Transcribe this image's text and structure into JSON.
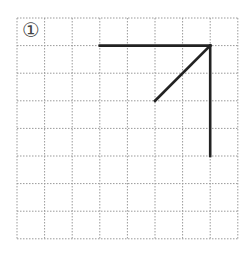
{
  "figure": {
    "label": "①",
    "grid": {
      "origin_x": 17,
      "origin_y": 18,
      "cell": 27.6,
      "cols": 8,
      "rows": 8,
      "line_color": "#9a9a9a"
    },
    "segments": [
      {
        "name": "top-horizontal-line",
        "from": [
          3,
          1
        ],
        "to": [
          7,
          1
        ]
      },
      {
        "name": "right-vertical-line",
        "from": [
          7,
          1
        ],
        "to": [
          7,
          5
        ]
      },
      {
        "name": "diagonal-line",
        "from": [
          7,
          1
        ],
        "to": [
          5,
          3
        ]
      }
    ],
    "stroke_color": "#222222",
    "stroke_width": 2.6
  }
}
